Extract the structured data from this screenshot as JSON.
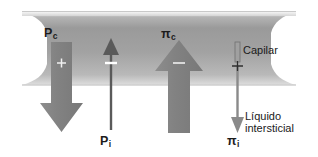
{
  "figure": {
    "background_color": "#ffffff",
    "capillary": {
      "label": "Capilar",
      "fill_dark": "#8e8e8e",
      "fill_light": "#d8d8d8",
      "edge_color": "#e8e8e8"
    },
    "interstitium": {
      "label_line1": "Líquido",
      "label_line2": "intersticial"
    },
    "arrows": [
      {
        "id": "pc",
        "symbol": "P",
        "subscript": "c",
        "label": "Pc",
        "sign": "+",
        "direction": "down",
        "style": "thick",
        "color": "#8a8a8a",
        "label_position": "top"
      },
      {
        "id": "pi",
        "symbol": "P",
        "subscript": "i",
        "label": "Pi",
        "sign": "−",
        "direction": "up",
        "style": "thin",
        "color": "#5f5f5f",
        "label_position": "bottom"
      },
      {
        "id": "pic",
        "symbol": "π",
        "subscript": "c",
        "label": "πc",
        "sign": "−",
        "direction": "up",
        "style": "thick",
        "color": "#8a8a8a",
        "label_position": "top"
      },
      {
        "id": "pii",
        "symbol": "π",
        "subscript": "i",
        "label": "πi",
        "sign": "+",
        "direction": "down",
        "style": "thin",
        "color": "#8a8a8a",
        "label_position": "bottom"
      }
    ]
  }
}
